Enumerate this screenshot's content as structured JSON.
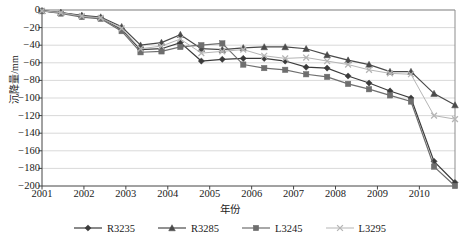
{
  "chart_data": {
    "type": "line",
    "title": "",
    "xlabel": "年份",
    "ylabel": "沉降量/mm",
    "xlim": [
      2001,
      2010.85
    ],
    "ylim": [
      -200,
      0
    ],
    "grid": true,
    "legend_position": "bottom",
    "xticks": [
      2001,
      2002,
      2003,
      2004,
      2005,
      2006,
      2007,
      2008,
      2009,
      2010
    ],
    "xtick_labels": [
      "2001",
      "2002",
      "2003",
      "2004",
      "2005",
      "2006",
      "2007",
      "2008",
      "2009",
      "2010"
    ],
    "yticks": [
      0,
      -20,
      -40,
      -60,
      -80,
      -100,
      -120,
      -140,
      -160,
      -180,
      -200
    ],
    "ytick_labels": [
      "0",
      "-20",
      "-40",
      "-60",
      "-80",
      "-100",
      "-120",
      "-140",
      "-160",
      "-180",
      "-200"
    ],
    "x": [
      2001.0,
      2001.45,
      2001.95,
      2002.4,
      2002.9,
      2003.35,
      2003.85,
      2004.3,
      2004.8,
      2005.3,
      2005.8,
      2006.3,
      2006.8,
      2007.3,
      2007.8,
      2008.3,
      2008.8,
      2009.3,
      2009.8,
      2010.35,
      2010.85
    ],
    "series": [
      {
        "name": "R3235",
        "marker": "diamond",
        "color": "#3b3b3b",
        "values": [
          -1,
          -3,
          -7,
          -9,
          -22,
          -45,
          -44,
          -37,
          -58,
          -56,
          -55,
          -55,
          -58,
          -65,
          -66,
          -75,
          -83,
          -92,
          -100,
          -172,
          -196
        ]
      },
      {
        "name": "R3285",
        "marker": "triangle",
        "color": "#4a4a4a",
        "values": [
          -1,
          -3,
          -6,
          -8,
          -19,
          -40,
          -37,
          -28,
          -44,
          -45,
          -43,
          -42,
          -42,
          -44,
          -51,
          -57,
          -62,
          -70,
          -70,
          -95,
          -108
        ]
      },
      {
        "name": "L3245",
        "marker": "square",
        "color": "#6e6e6e",
        "values": [
          -1,
          -4,
          -8,
          -10,
          -24,
          -48,
          -47,
          -42,
          -40,
          -38,
          -62,
          -66,
          -68,
          -73,
          -76,
          -84,
          -90,
          -97,
          -104,
          -178,
          -200
        ]
      },
      {
        "name": "L3295",
        "marker": "x",
        "color": "#b5b5b5",
        "values": [
          -1,
          -3,
          -7,
          -9,
          -21,
          -44,
          -41,
          -33,
          -49,
          -47,
          -45,
          -52,
          -55,
          -54,
          -58,
          -62,
          -68,
          -72,
          -73,
          -120,
          -124
        ]
      }
    ]
  }
}
